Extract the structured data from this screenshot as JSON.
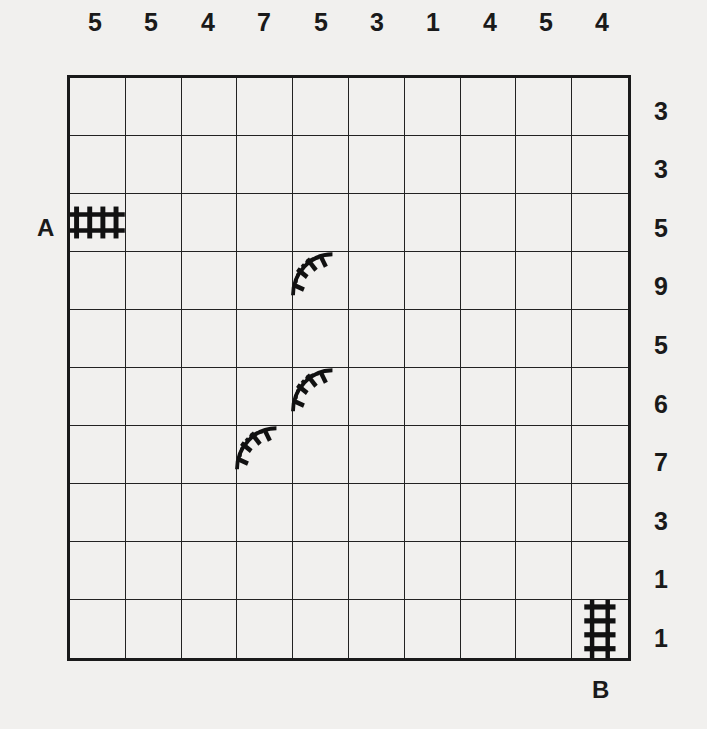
{
  "puzzle": {
    "type": "train-tracks",
    "size": 10,
    "column_clues": [
      "5",
      "5",
      "4",
      "7",
      "5",
      "3",
      "1",
      "4",
      "5",
      "4"
    ],
    "row_clues": [
      "3",
      "3",
      "5",
      "9",
      "5",
      "6",
      "7",
      "3",
      "1",
      "1"
    ],
    "start_label": "A",
    "end_label": "B",
    "given_tracks": [
      {
        "row": 2,
        "col": 0,
        "type": "straight-horizontal"
      },
      {
        "row": 3,
        "col": 4,
        "type": "curve"
      },
      {
        "row": 5,
        "col": 4,
        "type": "curve"
      },
      {
        "row": 6,
        "col": 3,
        "type": "curve"
      },
      {
        "row": 9,
        "col": 9,
        "type": "straight-vertical"
      }
    ]
  }
}
